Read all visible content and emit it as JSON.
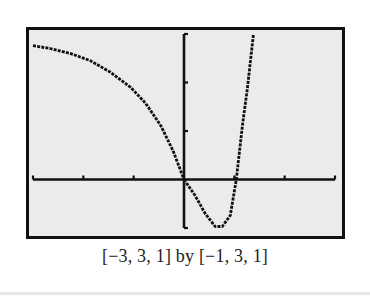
{
  "caption": "[−3, 3, 1] by [−1, 3, 1]",
  "colors": {
    "screen_bg": "#ebebeb",
    "ink": "#111111",
    "frame": "#111111"
  },
  "chart_data": {
    "type": "line",
    "title": "",
    "xlabel": "",
    "ylabel": "",
    "window": {
      "xmin": -3,
      "xmax": 3,
      "xscl": 1,
      "ymin": -1,
      "ymax": 3,
      "yscl": 1
    },
    "xlim": [
      -3,
      3
    ],
    "ylim": [
      -1,
      3
    ],
    "grid": false,
    "legend": null,
    "annotations": [
      "[−3, 3, 1] by [−1, 3, 1]"
    ],
    "series": [
      {
        "name": "left-branch",
        "x": [
          -3,
          -2.66,
          -2.26,
          -1.86,
          -1.46,
          -1.06,
          -0.76,
          -0.46,
          -0.22,
          0
        ],
        "y": [
          2.76,
          2.7,
          2.6,
          2.45,
          2.21,
          1.9,
          1.57,
          1.11,
          0.6,
          0
        ]
      },
      {
        "name": "right-branch",
        "x": [
          0,
          0.22,
          0.42,
          0.62,
          0.76,
          0.92,
          1.04,
          1.16,
          1.26,
          1.34,
          1.38
        ],
        "y": [
          0,
          -0.33,
          -0.7,
          -0.97,
          -0.97,
          -0.74,
          0,
          1.11,
          1.88,
          2.62,
          3
        ]
      }
    ]
  }
}
